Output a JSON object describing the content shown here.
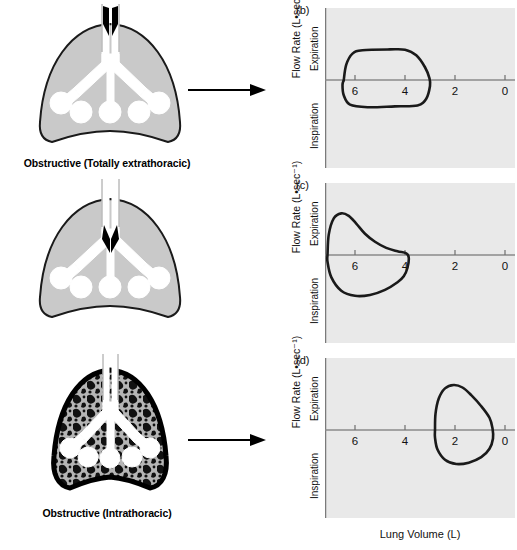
{
  "figure": {
    "xaxis_title": "Lung Volume (L)",
    "yaxis_title": "Flow Rate (L•sec⁻¹)",
    "direction_up": "Expiration",
    "direction_down": "Inspiration"
  },
  "rows": [
    {
      "panel_letter": "(b)",
      "caption": "Obstructive (Totally extrathoracic)",
      "lung_type": "shaded",
      "obstruction": "extrathoracic",
      "arrow": "right-arrow-icon"
    },
    {
      "panel_letter": "(c)",
      "caption": "Obstructive (Intrathoracic)",
      "lung_type": "shaded",
      "obstruction": "intrathoracic",
      "arrow": "right-arrow-icon"
    },
    {
      "panel_letter": "(d)",
      "caption": "Restrictive",
      "lung_type": "fibrotic",
      "obstruction": "none",
      "arrow": "right-arrow-icon"
    }
  ],
  "chart_data": [
    {
      "type": "line",
      "title": "(b)",
      "subtitle": "Obstructive (Totally extrathoracic)",
      "xlabel": "Lung Volume (L)",
      "ylabel": "Flow Rate (L•sec⁻¹)",
      "xticks": [
        6,
        4,
        2,
        0
      ],
      "xlim": [
        7.2,
        -0.4
      ],
      "ylim": [
        -4,
        4
      ],
      "x_axis_reversed": true,
      "grid": false,
      "annotations": [
        "Expiration",
        "Inspiration"
      ],
      "series": [
        {
          "name": "flow-volume loop",
          "closed": true,
          "points": [
            [
              6.45,
              0.0
            ],
            [
              6.35,
              0.9
            ],
            [
              6.1,
              1.55
            ],
            [
              5.7,
              1.75
            ],
            [
              4.6,
              1.8
            ],
            [
              4.0,
              1.78
            ],
            [
              3.55,
              1.45
            ],
            [
              3.2,
              0.75
            ],
            [
              3.02,
              0.1
            ],
            [
              3.0,
              -0.35
            ],
            [
              3.15,
              -1.1
            ],
            [
              3.5,
              -1.5
            ],
            [
              4.4,
              -1.55
            ],
            [
              5.5,
              -1.6
            ],
            [
              6.2,
              -1.45
            ],
            [
              6.45,
              -0.9
            ],
            [
              6.5,
              -0.3
            ],
            [
              6.45,
              0.0
            ]
          ]
        }
      ]
    },
    {
      "type": "line",
      "title": "(c)",
      "subtitle": "Obstructive (Intrathoracic)",
      "xlabel": "Lung Volume (L)",
      "ylabel": "Flow Rate (L•sec⁻¹)",
      "xticks": [
        6,
        4,
        2,
        0
      ],
      "xlim": [
        7.2,
        -0.4
      ],
      "ylim": [
        -4,
        4
      ],
      "x_axis_reversed": true,
      "grid": false,
      "annotations": [
        "Expiration",
        "Inspiration"
      ],
      "series": [
        {
          "name": "flow-volume loop",
          "closed": true,
          "points": [
            [
              7.1,
              0.0
            ],
            [
              7.05,
              1.2
            ],
            [
              6.85,
              2.15
            ],
            [
              6.55,
              2.45
            ],
            [
              6.25,
              2.3
            ],
            [
              5.95,
              1.85
            ],
            [
              5.6,
              1.25
            ],
            [
              5.2,
              0.78
            ],
            [
              4.75,
              0.42
            ],
            [
              4.3,
              0.22
            ],
            [
              3.95,
              0.1
            ],
            [
              3.85,
              -0.15
            ],
            [
              3.9,
              -0.75
            ],
            [
              4.05,
              -1.25
            ],
            [
              4.3,
              -1.6
            ],
            [
              4.8,
              -2.05
            ],
            [
              5.4,
              -2.35
            ],
            [
              6.0,
              -2.4
            ],
            [
              6.55,
              -2.1
            ],
            [
              6.95,
              -1.3
            ],
            [
              7.1,
              -0.4
            ],
            [
              7.1,
              0.0
            ]
          ]
        }
      ]
    },
    {
      "type": "line",
      "title": "(d)",
      "subtitle": "Restrictive",
      "xlabel": "Lung Volume (L)",
      "ylabel": "Flow Rate (L•sec⁻¹)",
      "xticks": [
        6,
        4,
        2,
        0
      ],
      "xlim": [
        7.2,
        -0.4
      ],
      "ylim": [
        -4,
        4
      ],
      "x_axis_reversed": true,
      "grid": false,
      "annotations": [
        "Expiration",
        "Inspiration"
      ],
      "series": [
        {
          "name": "flow-volume loop",
          "closed": true,
          "points": [
            [
              2.8,
              0.0
            ],
            [
              2.78,
              0.95
            ],
            [
              2.65,
              1.85
            ],
            [
              2.4,
              2.45
            ],
            [
              2.05,
              2.65
            ],
            [
              1.7,
              2.5
            ],
            [
              1.35,
              2.05
            ],
            [
              0.95,
              1.4
            ],
            [
              0.62,
              0.72
            ],
            [
              0.5,
              0.1
            ],
            [
              0.48,
              -0.5
            ],
            [
              0.62,
              -1.1
            ],
            [
              0.95,
              -1.6
            ],
            [
              1.45,
              -1.92
            ],
            [
              1.95,
              -2.0
            ],
            [
              2.4,
              -1.75
            ],
            [
              2.7,
              -1.15
            ],
            [
              2.8,
              -0.45
            ],
            [
              2.8,
              0.0
            ]
          ]
        }
      ]
    }
  ]
}
